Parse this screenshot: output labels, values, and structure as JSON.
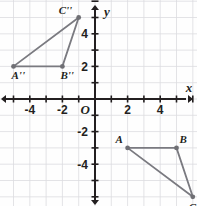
{
  "figure": {
    "type": "coordinate-plane",
    "background_color": "#ffffff",
    "grid_color": "#dcdce0",
    "axis_color": "#231f20",
    "shape_color": "#7a7a80",
    "point_color": "#6f6f74",
    "origin_label": "O",
    "x_axis_label": "x",
    "y_axis_label": "y",
    "x_ticks": [
      "-4",
      "-2",
      "2",
      "4"
    ],
    "y_ticks": [
      "4",
      "2",
      "-2",
      "-4"
    ],
    "x_tick_values": [
      -4,
      -2,
      2,
      4
    ],
    "y_tick_values": [
      4,
      2,
      -2,
      -4
    ],
    "x_range": [
      -6,
      6
    ],
    "y_range": [
      -7,
      6
    ]
  },
  "chart_data": {
    "type": "scatter",
    "title": "",
    "xlabel": "x",
    "ylabel": "y",
    "xlim": [
      -6,
      6
    ],
    "ylim": [
      -7,
      6
    ],
    "grid": true,
    "legend": "none",
    "series": [
      {
        "name": "Triangle A''B''C''",
        "closed": true,
        "points": [
          {
            "label": "A''",
            "x": -5,
            "y": 2,
            "label_dx": -2,
            "label_dy": 13
          },
          {
            "label": "B''",
            "x": -2,
            "y": 2,
            "label_dx": -2,
            "label_dy": 13
          },
          {
            "label": "C''",
            "x": -1,
            "y": 5,
            "label_dx": -20,
            "label_dy": -4
          }
        ]
      },
      {
        "name": "Triangle ABC",
        "closed": true,
        "points": [
          {
            "label": "A",
            "x": 2,
            "y": -3,
            "label_dx": -12,
            "label_dy": -5
          },
          {
            "label": "B",
            "x": 5,
            "y": -3,
            "label_dx": 3,
            "label_dy": -5
          },
          {
            "label": "C",
            "x": 6,
            "y": -6,
            "label_dx": -4,
            "label_dy": 14
          }
        ]
      }
    ]
  }
}
